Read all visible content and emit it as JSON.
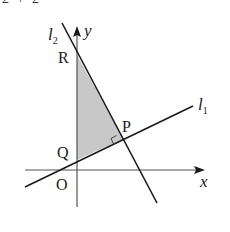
{
  "clipped_header_text": "2 + 2",
  "diagram": {
    "axes": {
      "x_label": "x",
      "y_label": "y",
      "origin_label": "O"
    },
    "lines": [
      {
        "id": "l1",
        "label": "l",
        "subscript": "1"
      },
      {
        "id": "l2",
        "label": "l",
        "subscript": "2"
      }
    ],
    "points": {
      "P": "P",
      "Q": "Q",
      "R": "R"
    },
    "shaded_region": "triangle PQR",
    "right_angle_at": "P",
    "colors": {
      "line": "#1a1a1a",
      "shade": "#c8c8c8",
      "axis": "#555555"
    }
  }
}
